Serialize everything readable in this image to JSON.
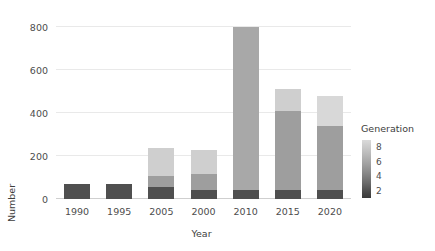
{
  "chart_data": {
    "type": "bar",
    "stacked": true,
    "title": "",
    "xlabel": "Year",
    "ylabel": "Number",
    "categories": [
      "1990",
      "1995",
      "2005",
      "2000",
      "2010",
      "2015",
      "2020"
    ],
    "ylim": [
      0,
      840
    ],
    "yticks": [
      0,
      200,
      400,
      600,
      800
    ],
    "ytick_labels": [
      "0",
      "200",
      "400",
      "600",
      "800"
    ],
    "grid": true,
    "legend": {
      "title": "Generation",
      "type": "colorbar",
      "position": "right",
      "ticks": [
        8,
        6,
        4,
        2
      ],
      "tick_labels": [
        "8",
        "6",
        "4",
        "2"
      ],
      "range": [
        1,
        9
      ],
      "color_low": "#3a3a3a",
      "color_high": "#dadada"
    },
    "series": [
      {
        "name": "2",
        "color": "#4f4f4f",
        "values": [
          72,
          72,
          58,
          42,
          40,
          42,
          40
        ]
      },
      {
        "name": "4",
        "color": "#7a7a7a",
        "values": [
          0,
          0,
          0,
          0,
          0,
          0,
          0
        ]
      },
      {
        "name": "6",
        "color": "#9e9e9e",
        "values": [
          0,
          0,
          48,
          75,
          760,
          368,
          300
        ]
      },
      {
        "name": "8",
        "color": "#cfcfcf",
        "values": [
          0,
          0,
          130,
          110,
          0,
          100,
          140
        ]
      }
    ],
    "totals": [
      72,
      72,
      236,
      227,
      800,
      510,
      480
    ],
    "bars": [
      {
        "category": "1990",
        "total": 72,
        "segments": [
          {
            "gen": "2",
            "value": 72,
            "color": "#4f4f4f"
          }
        ]
      },
      {
        "category": "1995",
        "total": 72,
        "segments": [
          {
            "gen": "2",
            "value": 72,
            "color": "#4f4f4f"
          }
        ]
      },
      {
        "category": "2005",
        "total": 236,
        "segments": [
          {
            "gen": "2",
            "value": 58,
            "color": "#4f4f4f"
          },
          {
            "gen": "6",
            "value": 48,
            "color": "#9e9e9e"
          },
          {
            "gen": "8",
            "value": 130,
            "color": "#cfcfcf"
          }
        ]
      },
      {
        "category": "2000",
        "total": 227,
        "segments": [
          {
            "gen": "2",
            "value": 42,
            "color": "#4f4f4f"
          },
          {
            "gen": "6",
            "value": 75,
            "color": "#9e9e9e"
          },
          {
            "gen": "8",
            "value": 110,
            "color": "#cfcfcf"
          }
        ]
      },
      {
        "category": "2010",
        "total": 800,
        "segments": [
          {
            "gen": "2",
            "value": 40,
            "color": "#4f4f4f"
          },
          {
            "gen": "6",
            "value": 760,
            "color": "#a8a8a8"
          }
        ]
      },
      {
        "category": "2015",
        "total": 510,
        "segments": [
          {
            "gen": "2",
            "value": 42,
            "color": "#4f4f4f"
          },
          {
            "gen": "6",
            "value": 368,
            "color": "#9e9e9e"
          },
          {
            "gen": "8",
            "value": 100,
            "color": "#cfcfcf"
          }
        ]
      },
      {
        "category": "2020",
        "total": 480,
        "segments": [
          {
            "gen": "2",
            "value": 40,
            "color": "#4f4f4f"
          },
          {
            "gen": "6",
            "value": 300,
            "color": "#9e9e9e"
          },
          {
            "gen": "8",
            "value": 140,
            "color": "#d8d8d8"
          }
        ]
      }
    ]
  }
}
